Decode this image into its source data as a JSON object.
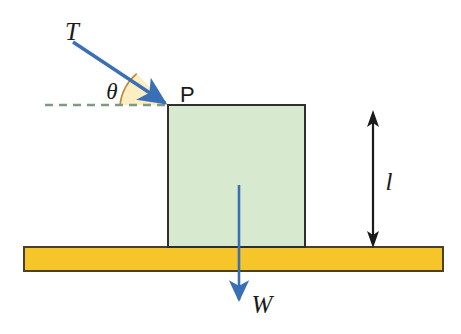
{
  "figure": {
    "canvas": {
      "width": 461,
      "height": 334,
      "background": "#ffffff"
    },
    "colors": {
      "force_arrow": "#3a6fb5",
      "block_fill": "#d7ead0",
      "block_stroke": "#2f2f2f",
      "ground_fill": "#f5c52a",
      "ground_stroke": "#4a4024",
      "angle_wedge_fill": "#faeec2",
      "angle_wedge_stroke": "#c08a3e",
      "dashed_line": "#7f9a82",
      "dimension_arrow": "#1a1a1a",
      "label_text": "#1a1a1a"
    },
    "labels": {
      "tension": "T",
      "angle": "θ",
      "point": "P",
      "weight": "W",
      "length": "l"
    },
    "block": {
      "x": 168,
      "y": 105,
      "width": 137,
      "height": 142
    },
    "ground": {
      "x": 24,
      "y": 247,
      "width": 419,
      "height": 24
    },
    "tension_arrow": {
      "x1": 73,
      "y1": 42,
      "x2": 168,
      "y2": 105
    },
    "weight_arrow": {
      "x1": 239,
      "y1": 185,
      "x2": 239,
      "y2": 303
    },
    "dashed_baseline": {
      "x1": 45,
      "y1": 105,
      "x2": 170,
      "y2": 105
    },
    "angle_wedge": {
      "cx": 168,
      "cy": 105,
      "radius": 48
    },
    "dimension_line": {
      "x": 373,
      "y1": 112,
      "y2": 247
    }
  }
}
